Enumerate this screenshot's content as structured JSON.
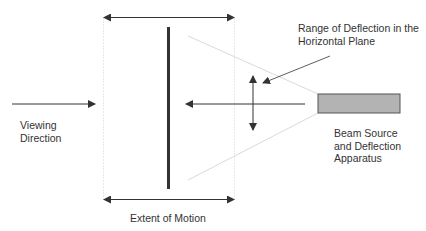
{
  "labels": {
    "range_line1": "Range of Deflection in the",
    "range_line2": "Horizontal Plane",
    "viewing_line1": "Viewing",
    "viewing_line2": "Direction",
    "beam_line1": "Beam Source",
    "beam_line2": "and Deflection",
    "beam_line3": "Apparatus",
    "extent": "Extent of Motion"
  },
  "colors": {
    "line": "#333333",
    "dotted": "#cfcfcf",
    "cone": "#d8d8d8",
    "source_fill": "#b3b3b3",
    "source_stroke": "#555555"
  }
}
